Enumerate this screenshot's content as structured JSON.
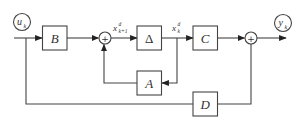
{
  "diagram": {
    "type": "state-space block diagram",
    "input": {
      "symbol": "u",
      "subscript": "k"
    },
    "output": {
      "symbol": "y",
      "subscript": "k"
    },
    "blocks": [
      {
        "id": "B",
        "label": "B"
      },
      {
        "id": "Delta",
        "label": "Δ"
      },
      {
        "id": "C",
        "label": "C"
      },
      {
        "id": "A",
        "label": "A"
      },
      {
        "id": "D",
        "label": "D"
      }
    ],
    "summing_junctions": [
      {
        "id": "sum1",
        "symbol": "+"
      },
      {
        "id": "sum2",
        "symbol": "+"
      }
    ],
    "signals": {
      "x_next": {
        "symbol": "x",
        "superscript": "d",
        "subscript": "k+1"
      },
      "x_curr": {
        "symbol": "x",
        "superscript": "d",
        "subscript": "k"
      }
    },
    "connections": [
      "u_k -> B",
      "B -> sum1",
      "sum1 -> Delta (x^d_{k+1})",
      "Delta -> C (x^d_k)",
      "x^d_k -> A",
      "A -> sum1",
      "C -> sum2",
      "u_k -> D",
      "D -> sum2",
      "sum2 -> y_k"
    ],
    "colors": {
      "line": "#444444",
      "background": "#ffffff"
    }
  }
}
